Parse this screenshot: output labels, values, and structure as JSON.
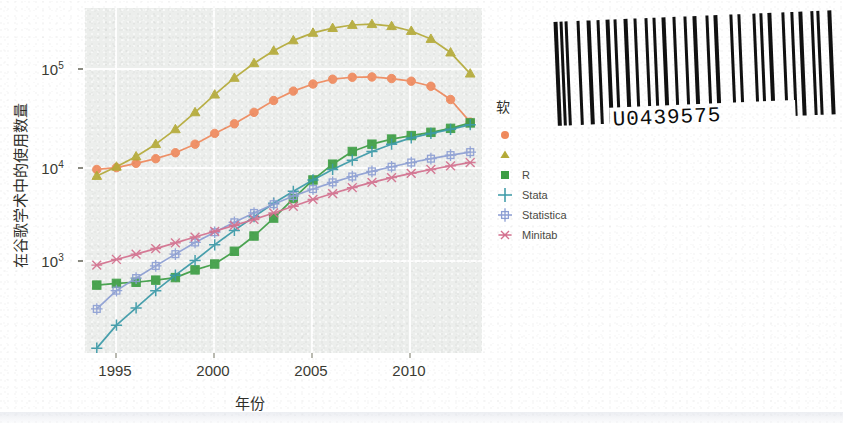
{
  "chart_data": {
    "type": "line",
    "title": "",
    "xlabel": "年份",
    "ylabel": "在谷歌学术中的使用数量",
    "yscale": "log",
    "xlim": [
      1994.4,
      2014.6
    ],
    "ylim": [
      180,
      330000
    ],
    "grid": true,
    "legend_position": "right",
    "legend_title": "软",
    "xticks": [
      "1995",
      "2000",
      "2005",
      "2010"
    ],
    "xtick_values": [
      1995,
      2000,
      2005,
      2010
    ],
    "yticks": [
      "10³",
      "10⁴",
      "10⁵"
    ],
    "ytick_values": [
      1000,
      10000,
      100000
    ],
    "x": [
      1995,
      1996,
      1997,
      1998,
      1999,
      2000,
      2001,
      2002,
      2003,
      2004,
      2005,
      2006,
      2007,
      2008,
      2009,
      2010,
      2011,
      2012,
      2013,
      2014
    ],
    "series": [
      {
        "name": "",
        "label": "",
        "color": "#f08a5d",
        "marker": "circle",
        "values": [
          9800,
          10200,
          11200,
          12400,
          14100,
          17000,
          21500,
          26500,
          34000,
          44000,
          54000,
          63000,
          70000,
          73000,
          73500,
          71000,
          67000,
          60000,
          45000,
          27500
        ]
      },
      {
        "name": "",
        "label": "",
        "color": "#b5ab39",
        "marker": "triangle",
        "values": [
          8500,
          10400,
          13000,
          17000,
          23500,
          34000,
          50000,
          72000,
          99000,
          130000,
          163000,
          192000,
          213000,
          228000,
          232000,
          222000,
          200000,
          168000,
          125000,
          79000
        ]
      },
      {
        "name": "R",
        "label": "R",
        "color": "#3d9e44",
        "marker": "square",
        "values": [
          790,
          820,
          840,
          880,
          930,
          1100,
          1250,
          1650,
          2300,
          3400,
          5200,
          7800,
          11000,
          14500,
          17000,
          19000,
          20500,
          22000,
          24000,
          27000
        ]
      },
      {
        "name": "Stata",
        "label": "Stata",
        "color": "#3b9aa8",
        "marker": "plus",
        "values": [
          200,
          330,
          480,
          700,
          980,
          1350,
          1900,
          2600,
          3500,
          4700,
          6100,
          7800,
          9800,
          12000,
          14500,
          17000,
          19500,
          21500,
          23500,
          26000
        ]
      },
      {
        "name": "Statistica",
        "label": "Statistica",
        "color": "#8d9fd4",
        "marker": "square-plus",
        "values": [
          470,
          700,
          920,
          1200,
          1550,
          2000,
          2500,
          3100,
          3800,
          4600,
          5500,
          6400,
          7400,
          8400,
          9400,
          10400,
          11400,
          12400,
          13400,
          14300
        ]
      },
      {
        "name": "Minitab",
        "label": "Minitab",
        "color": "#d4718f",
        "marker": "asterisk",
        "values": [
          1220,
          1380,
          1550,
          1750,
          1980,
          2250,
          2550,
          2900,
          3300,
          3800,
          4400,
          5100,
          5800,
          6600,
          7400,
          8200,
          9000,
          9800,
          10600,
          11400
        ]
      }
    ]
  },
  "legend": {
    "title": "软",
    "entries": [
      {
        "label": "",
        "color": "#f08a5d",
        "marker": "circle"
      },
      {
        "label": "",
        "color": "#b5ab39",
        "marker": "triangle"
      },
      {
        "label": "R",
        "color": "#3d9e44",
        "marker": "square"
      },
      {
        "label": "Stata",
        "color": "#3b9aa8",
        "marker": "plus"
      },
      {
        "label": "Statistica",
        "color": "#8d9fd4",
        "marker": "square-plus"
      },
      {
        "label": "Minitab",
        "color": "#d4718f",
        "marker": "asterisk"
      }
    ]
  },
  "axes": {
    "xlabel": "年份",
    "ylabel": "在谷歌学术中的使用数量",
    "xticks": [
      "1995",
      "2000",
      "2005",
      "2010"
    ],
    "ylabels": [
      {
        "base": "10",
        "exp": "5"
      },
      {
        "base": "10",
        "exp": "4"
      },
      {
        "base": "10",
        "exp": "3"
      }
    ]
  },
  "barcode": {
    "number": "U0439575",
    "pattern": [
      4,
      2,
      3,
      2,
      3,
      9,
      3,
      7,
      4,
      6,
      3,
      6,
      4,
      4,
      3,
      7,
      4,
      6,
      3,
      8,
      3,
      5,
      3,
      6,
      4,
      7,
      3,
      8,
      3,
      6,
      4,
      9,
      3,
      5,
      4,
      12,
      3,
      5,
      3,
      12,
      3,
      4,
      3,
      5,
      4,
      10,
      3,
      6,
      3,
      5,
      4,
      8,
      3,
      3,
      3,
      8,
      4,
      3
    ]
  },
  "colors": {
    "plot_background": "#eceeec",
    "gridline": "#fdfdfd",
    "page_background": "#ffffff",
    "axis_text": "#3b3b33"
  }
}
